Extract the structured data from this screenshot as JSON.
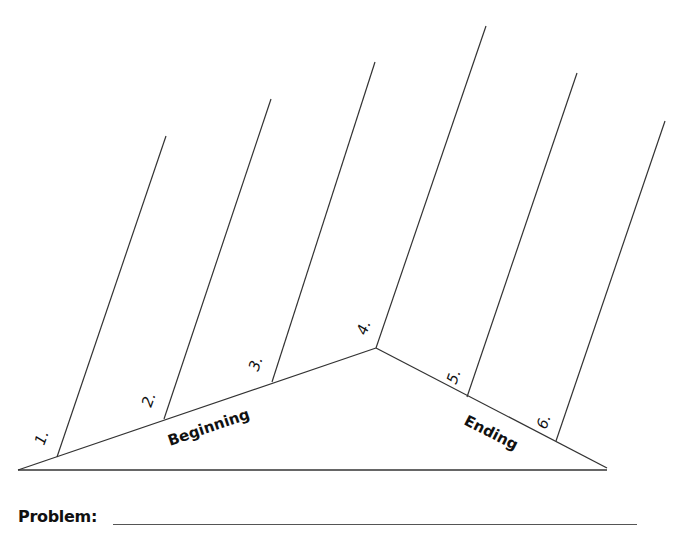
{
  "diagram": {
    "type": "fishbone / story map",
    "sections": {
      "beginning": "Beginning",
      "ending": "Ending"
    },
    "bones": [
      {
        "label": "1.",
        "top": [
          166,
          136
        ],
        "base": [
          57,
          457
        ],
        "label_pos": [
          44,
          446
        ],
        "angle": -70
      },
      {
        "label": "2.",
        "top": [
          271,
          99
        ],
        "base": [
          164,
          419
        ],
        "label_pos": [
          151,
          408
        ],
        "angle": -70
      },
      {
        "label": "3.",
        "top": [
          375,
          62
        ],
        "base": [
          272,
          382
        ],
        "label_pos": [
          258,
          372
        ],
        "angle": -70
      },
      {
        "label": "4.",
        "top": [
          486,
          26
        ],
        "base": [
          376,
          348
        ],
        "label_pos": [
          366,
          336
        ],
        "angle": -70
      },
      {
        "label": "5.",
        "top": [
          577,
          73
        ],
        "base": [
          467,
          397
        ],
        "label_pos": [
          456,
          385
        ],
        "angle": -70
      },
      {
        "label": "6.",
        "top": [
          665,
          121
        ],
        "base": [
          556,
          441
        ],
        "label_pos": [
          546,
          430
        ],
        "angle": -70
      }
    ],
    "triangle": {
      "left": [
        18,
        470
      ],
      "apex": [
        376,
        348
      ],
      "right": [
        607,
        468
      ]
    },
    "line_color": "#333333"
  },
  "problem": {
    "label": "Problem:"
  }
}
